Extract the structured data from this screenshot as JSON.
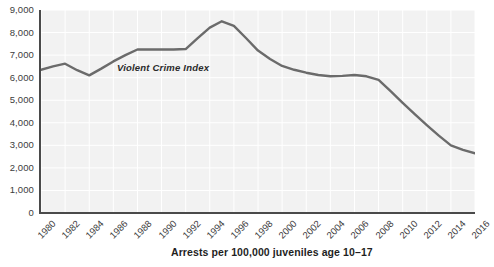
{
  "chart_data": {
    "type": "line",
    "title": "",
    "subtitle": "",
    "xlabel": "Arrests per 100,000 juveniles age 10–17",
    "ylabel": "",
    "xlim": [
      1980,
      2016
    ],
    "ylim": [
      0,
      9000
    ],
    "grid": true,
    "legend_position": "inline",
    "annotations": [
      {
        "text": "Violent Crime Index",
        "x": 1989.5,
        "y": 6450
      }
    ],
    "ytick_labels": [
      "0",
      "1,000",
      "2,000",
      "3,000",
      "4,000",
      "5,000",
      "6,000",
      "7,000",
      "8,000",
      "9,000"
    ],
    "ytick_values": [
      0,
      1000,
      2000,
      3000,
      4000,
      5000,
      6000,
      7000,
      8000,
      9000
    ],
    "xtick_labels": [
      "1980",
      "1982",
      "1984",
      "1986",
      "1988",
      "1990",
      "1992",
      "1994",
      "1996",
      "1998",
      "2000",
      "2002",
      "2004",
      "2006",
      "2008",
      "2010",
      "2012",
      "2014",
      "2016"
    ],
    "xtick_values": [
      1980,
      1982,
      1984,
      1986,
      1988,
      1990,
      1992,
      1994,
      1996,
      1998,
      2000,
      2002,
      2004,
      2006,
      2008,
      2010,
      2012,
      2014,
      2016
    ],
    "series": [
      {
        "name": "Violent Crime Index",
        "color": "#6b6b6b",
        "x": [
          1980,
          1981,
          1982,
          1983,
          1984,
          1985,
          1986,
          1987,
          1988,
          1989,
          1990,
          1991,
          1992,
          1993,
          1994,
          1995,
          1996,
          1997,
          1998,
          1999,
          2000,
          2001,
          2002,
          2003,
          2004,
          2005,
          2006,
          2007,
          2008,
          2009,
          2010,
          2011,
          2012,
          2013,
          2014,
          2015,
          2016
        ],
        "values": [
          6350,
          6500,
          6620,
          6330,
          6100,
          6400,
          6720,
          7000,
          7250,
          7250,
          7250,
          7250,
          7270,
          7750,
          8220,
          8500,
          8300,
          7760,
          7200,
          6830,
          6520,
          6350,
          6220,
          6120,
          6060,
          6080,
          6120,
          6060,
          5900,
          5400,
          4880,
          4380,
          3900,
          3430,
          3000,
          2800,
          2650
        ]
      }
    ]
  },
  "colors": {
    "plot_background": "#f2f2f2",
    "grid": "#ffffff",
    "axis": "#4a4a4a",
    "line": "#6b6b6b",
    "text": "#3c3c3c",
    "title_text": "#1f1f1f"
  }
}
